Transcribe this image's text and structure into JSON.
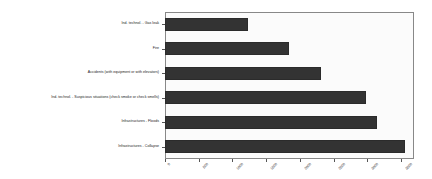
{
  "chart_data": {
    "type": "bar",
    "orientation": "horizontal",
    "title": "",
    "xlabel": "",
    "ylabel": "",
    "xlim": [
      0,
      3690
    ],
    "xticks": [
      0,
      500,
      1000,
      1500,
      2000,
      2500,
      3000,
      3500
    ],
    "xtick_labels": [
      "0",
      "500",
      "1000",
      "1500",
      "2000",
      "2500",
      "3000",
      "3500"
    ],
    "grid": false,
    "legend": null,
    "bar_color": "#333333",
    "plot_background": "#fbfbfb",
    "categories": [
      "Ind. technol. - Gas leak",
      "Fire",
      "Accidents (with equipment or with elevators)",
      "Ind. technol. - Suspicious situations (check smoke or check smells)",
      "Infrastructures - Floods",
      "Infrastructures - Collapse"
    ],
    "values": [
      1230,
      1840,
      2315,
      2980,
      3145,
      3560
    ]
  }
}
